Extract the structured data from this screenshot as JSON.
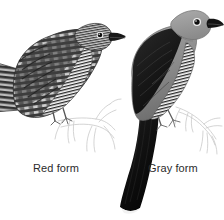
{
  "figure": {
    "kind": "natural-history-illustration",
    "background_color": "#ffffff",
    "width": 224,
    "height": 220
  },
  "labels": {
    "red_form": "Red form",
    "gray_form": "Gray form"
  },
  "palette": {
    "background": "#ffffff",
    "caption_text": "#2b2b2b",
    "ink_black": "#111111",
    "wing_dark": "#1d1d1d",
    "body_gray": "#8d8d8d",
    "head_gray": "#9a9a9a",
    "bar_dark": "#2e2e2e",
    "underpart_white": "#f7f7f7",
    "branch_line": "#c9c9c9",
    "red_form_dark": "#3a3a3a",
    "red_form_mid": "#6e6e6e",
    "red_form_light": "#b5b5b5"
  },
  "birds": [
    {
      "id": "red-form",
      "label": "Red form",
      "position": "left",
      "facing": "right",
      "plumage": "heavily barred dark and light upperparts, barred white underparts",
      "tail": "barred, extends off left edge of frame",
      "eye": "dark with pale ring",
      "bill": "short dark decurved"
    },
    {
      "id": "gray-form",
      "label": "Gray form",
      "position": "right",
      "facing": "right",
      "plumage": "plain gray head and back, blackish wing, barred white underparts",
      "tail": "long blackish with white tip, angled down to lower frame",
      "eye": "dark with pale ring",
      "bill": "short dark decurved"
    }
  ],
  "perches": [
    {
      "id": "branch-left",
      "style": "faint pencil outline"
    },
    {
      "id": "branch-right",
      "style": "faint pencil outline"
    }
  ]
}
